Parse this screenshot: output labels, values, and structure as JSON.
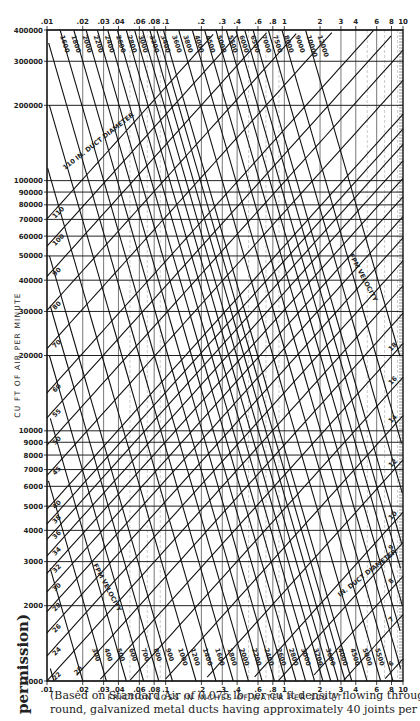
{
  "chart_data": {
    "type": "line",
    "xlabel": "FRICTION LOSS IN INCHES OF WATER PER 100 FT",
    "ylabel": "CU FT OF AIR PER MINUTE",
    "xscale": "log",
    "yscale": "log",
    "xlim": [
      0.01,
      10
    ],
    "ylim": [
      1000,
      400000
    ],
    "grid": true,
    "x_ticks": [
      ".01",
      ".02",
      ".03",
      ".04",
      ".06",
      ".08",
      ".1",
      ".2",
      ".3",
      ".4",
      ".6",
      ".8",
      "1",
      "2",
      "3",
      "4",
      "6",
      "8",
      "10"
    ],
    "x_tick_values": [
      0.01,
      0.02,
      0.03,
      0.04,
      0.06,
      0.08,
      0.1,
      0.2,
      0.3,
      0.4,
      0.6,
      0.8,
      1,
      2,
      3,
      4,
      6,
      8,
      10
    ],
    "y_ticks": [
      "400000",
      "300000",
      "200000",
      "100000",
      "90000",
      "80000",
      "70000",
      "60000",
      "50000",
      "40000",
      "30000",
      "20000",
      "10000",
      "9000",
      "8000",
      "7000",
      "6000",
      "5000",
      "4000",
      "3000",
      "2000",
      "1000"
    ],
    "y_tick_values": [
      400000,
      300000,
      200000,
      100000,
      90000,
      80000,
      70000,
      60000,
      50000,
      40000,
      30000,
      20000,
      10000,
      9000,
      8000,
      7000,
      6000,
      5000,
      4000,
      3000,
      2000,
      1000
    ],
    "series_groups": [
      {
        "name": "IN. DUCT DIAMETER",
        "label_top_left": "110 IN. DUCT DIAMETER",
        "label_bottom_right": "IN. DUCT DIAMETER",
        "direction": "rising left-to-right",
        "values_in": [
          110,
          100,
          90,
          80,
          70,
          60,
          55,
          50,
          45,
          40,
          38,
          36,
          34,
          32,
          30,
          28,
          26,
          24,
          22,
          20,
          18,
          16,
          14,
          12,
          10,
          9,
          8,
          7,
          6,
          5,
          4
        ]
      },
      {
        "name": "FPM VELOCITY",
        "direction": "falling left-to-right",
        "top_values": [
          "1600",
          "1800",
          "2000",
          "2200",
          "2400",
          "2600",
          "2800",
          "3000",
          "3200",
          "3400",
          "3600",
          "3800",
          "4000",
          "4500",
          "5000",
          "5500",
          "6000",
          "6500",
          "7000",
          "7500",
          "8000",
          "9000",
          "10000",
          "12000"
        ],
        "bottom_values": [
          "300",
          "400",
          "500",
          "600",
          "700",
          "800",
          "900",
          "1000",
          "1200",
          "1400",
          "1600",
          "1800",
          "2000",
          "2200",
          "2400",
          "2600",
          "2800",
          "3000",
          "3200",
          "3600",
          "4000",
          "4500",
          "5000",
          "5500"
        ]
      }
    ]
  },
  "axis": {
    "x_title": "FRICTION LOSS IN INCHES OF WATER PER 100 FT",
    "y_title": "CU FT OF AIR PER MINUTE",
    "diameter_label_top": "110 IN. DUCT DIAMETER",
    "diameter_label_bottom": "IN. DUCT DIAMETER",
    "velocity_label_left": "FPM VELOCITY",
    "velocity_label_right": "FPM VELOCITY"
  },
  "caption": {
    "line1": "(Based on Standard Air of 0.075 lb per cu ft density flowing through average, clean",
    "line2": "round, galvanized metal ducts having approximately 40 joints per 100 ft.)"
  },
  "side_note": "permission)"
}
